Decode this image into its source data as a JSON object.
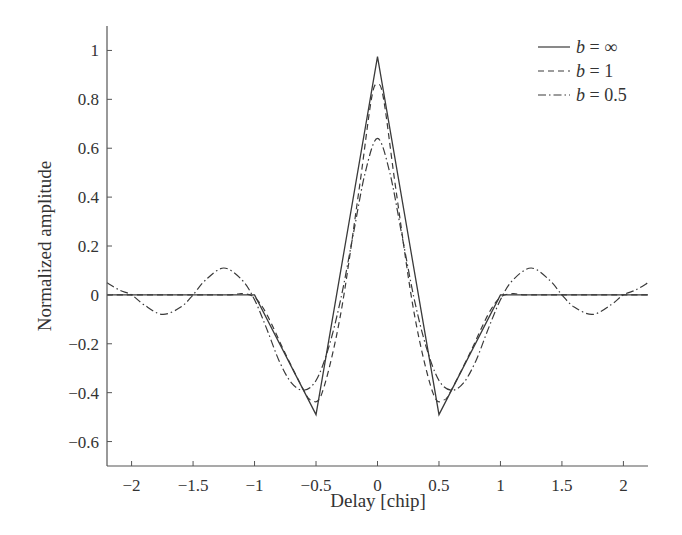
{
  "chart_data": {
    "type": "line",
    "title": "",
    "xlabel": "Delay [chip]",
    "ylabel": "Normalized amplitude",
    "xlim": [
      -2.2,
      2.2
    ],
    "ylim": [
      -0.7,
      1.1
    ],
    "grid": false,
    "legend_position": "upper right",
    "x_ticks": [
      -2,
      -1.5,
      -1,
      -0.5,
      0,
      0.5,
      1,
      1.5,
      2
    ],
    "x_tick_labels": [
      "−2",
      "−1.5",
      "−1",
      "−0.5",
      "0",
      "0.5",
      "1",
      "1.5",
      "2"
    ],
    "y_ticks": [
      1,
      0.8,
      0.6,
      0.4,
      0.2,
      0,
      -0.2,
      -0.4,
      -0.6
    ],
    "y_tick_labels": [
      "1",
      "0.8",
      "0.6",
      "0.4",
      "0.2",
      "0",
      "−0.2",
      "−0.4",
      "−0.6"
    ],
    "series": [
      {
        "name": "b = ∞",
        "style": "solid",
        "x": [
          -2.2,
          -1.0,
          -0.5,
          0.0,
          0.5,
          1.0,
          2.2
        ],
        "y": [
          0.0,
          0.0,
          -0.49,
          0.975,
          -0.49,
          0.0,
          0.0
        ]
      },
      {
        "name": "b = 1",
        "style": "dashed",
        "x": [
          -2.2,
          -1.5,
          -1.2,
          -1.1,
          -1.0,
          -0.9,
          -0.75,
          -0.6,
          -0.54,
          -0.45,
          -0.3,
          -0.15,
          -0.05,
          0.0,
          0.05,
          0.15,
          0.3,
          0.45,
          0.54,
          0.6,
          0.75,
          0.9,
          1.0,
          1.1,
          1.2,
          1.5,
          2.2
        ],
        "y": [
          0.0,
          0.0,
          0.0,
          0.005,
          -0.01,
          -0.08,
          -0.24,
          -0.39,
          -0.43,
          -0.4,
          -0.08,
          0.43,
          0.8,
          0.86,
          0.8,
          0.43,
          -0.08,
          -0.4,
          -0.43,
          -0.39,
          -0.24,
          -0.08,
          -0.01,
          0.005,
          0.0,
          0.0,
          0.0
        ]
      },
      {
        "name": "b = 0.5",
        "style": "dashdot",
        "x": [
          -2.2,
          -2.1,
          -2.0,
          -1.9,
          -1.75,
          -1.6,
          -1.5,
          -1.4,
          -1.25,
          -1.1,
          -1.0,
          -0.9,
          -0.8,
          -0.7,
          -0.6,
          -0.5,
          -0.4,
          -0.3,
          -0.2,
          -0.1,
          0.0,
          0.1,
          0.2,
          0.3,
          0.4,
          0.5,
          0.6,
          0.7,
          0.8,
          0.9,
          1.0,
          1.1,
          1.25,
          1.4,
          1.5,
          1.6,
          1.75,
          1.9,
          2.0,
          2.1,
          2.2
        ],
        "y": [
          0.05,
          0.02,
          0.0,
          -0.04,
          -0.08,
          -0.05,
          0.0,
          0.06,
          0.11,
          0.06,
          -0.02,
          -0.14,
          -0.27,
          -0.36,
          -0.39,
          -0.35,
          -0.22,
          -0.02,
          0.24,
          0.5,
          0.64,
          0.5,
          0.24,
          -0.02,
          -0.22,
          -0.35,
          -0.39,
          -0.36,
          -0.27,
          -0.14,
          -0.02,
          0.06,
          0.11,
          0.06,
          0.0,
          -0.05,
          -0.08,
          -0.04,
          0.0,
          0.02,
          0.05
        ]
      }
    ]
  },
  "legend": {
    "items": [
      {
        "var": "b",
        "rest": " = ∞",
        "style": "solid"
      },
      {
        "var": "b",
        "rest": " = 1",
        "style": "dashed"
      },
      {
        "var": "b",
        "rest": " = 0.5",
        "style": "dashdot"
      }
    ]
  },
  "colors": {
    "line": "#3a3a3a",
    "axis": "#555555",
    "text": "#333333"
  }
}
